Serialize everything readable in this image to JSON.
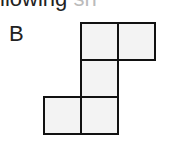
{
  "header": {
    "partial_text": "llowing",
    "faded_text": " sh"
  },
  "figure": {
    "label": "B",
    "cell_fill": "#f3f3f3",
    "border_color": "#111111",
    "cells": [
      {
        "row": 0,
        "col": 1
      },
      {
        "row": 0,
        "col": 2
      },
      {
        "row": 1,
        "col": 1
      },
      {
        "row": 2,
        "col": 0
      },
      {
        "row": 2,
        "col": 1
      }
    ]
  }
}
